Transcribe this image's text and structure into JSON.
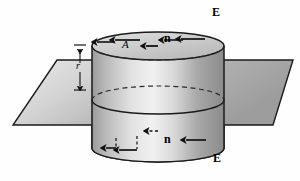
{
  "figure": {
    "background_color": "#fefefe",
    "line_color": "#1a1a1a",
    "plane_fill_light": "#e6e6e6",
    "plane_fill_dark": "#a8a8a8",
    "cylinder_fill_light": "#efefef",
    "cylinder_fill_dark": "#8e8e8e",
    "top_cap_fill": "#cfcfcf"
  },
  "labels": {
    "area": "A",
    "radius": "r",
    "normal_top": "n",
    "normal_bottom": "n",
    "field_top": "E",
    "field_bottom": "E"
  },
  "geometry": {
    "cylinder": {
      "left_x": 92,
      "right_x": 224,
      "top_cap_center_y": 46,
      "bottom_cap_center_y": 148,
      "cap_rx": 66,
      "cap_ry": 14,
      "mid_ellipse_center_y": 100
    },
    "plane": {
      "top_left": [
        57,
        60
      ],
      "top_right": [
        293,
        60
      ],
      "bottom_right": [
        273,
        125
      ],
      "bottom_left": [
        13,
        125
      ]
    },
    "dimension_line": {
      "x": 80,
      "top_y": 45,
      "bottom_y": 90,
      "cap_half_width": 6
    }
  },
  "field_arrows_top": [
    {
      "x": 115,
      "y_start": 42,
      "y_end": 17,
      "style": "solid"
    },
    {
      "x": 140,
      "y_start": 40,
      "y_end": 8,
      "style": "solid"
    },
    {
      "x": 183,
      "y_start": 40,
      "y_end": 14,
      "style": "solid"
    },
    {
      "x": 205,
      "y_start": 39,
      "y_end": 8,
      "style": "solid"
    }
  ],
  "field_arrows_bottom": [
    {
      "x": 116,
      "y_start": 140,
      "y_end": 165,
      "style": "dashed-then-solid"
    },
    {
      "x": 137,
      "y_start": 138,
      "y_end": 175,
      "style": "dashed-then-solid"
    },
    {
      "x": 206,
      "y_start": 140,
      "y_end": 168,
      "style": "solid"
    }
  ],
  "normal_arrows": [
    {
      "name": "top-normal",
      "x": 158,
      "y_start": 46,
      "y_end": 28,
      "style": "solid",
      "direction": "up"
    },
    {
      "name": "bottom-normal",
      "x": 158,
      "y_start": 131,
      "y_end": 148,
      "style": "dashed",
      "direction": "down"
    }
  ]
}
